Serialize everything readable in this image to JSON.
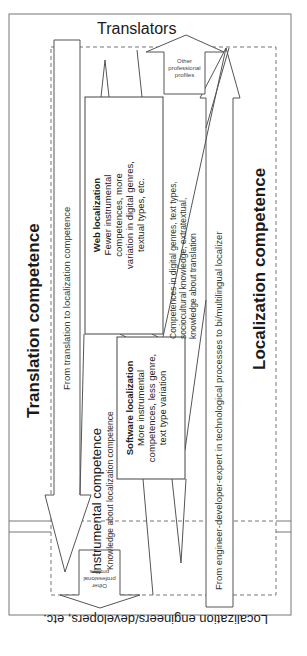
{
  "diagram": {
    "top_label": "Translators",
    "bottom_label": "Localization engineers/developers, etc.",
    "left_title": "Translation competence",
    "right_title": "Localization competence",
    "left_arrow_label": "From translation to localization competence",
    "right_arrow_label": "From engineer-developer-expert in technological processes to bi/multilingual localizer",
    "instrumental": {
      "title": "Instrumental competence",
      "subtitle": "Knowledge about localization competence"
    },
    "translation_knowledge": {
      "line1": "Competences in digital genres, text types,",
      "line2": "sociocultural knowledge, extratextual,",
      "line3": "knowledge about translation"
    },
    "web_localization": {
      "title": "Web localization",
      "line1": "Fewer instrumental",
      "line2": "competences, more",
      "line3": "variation in digital genres,",
      "line4": "textual types, etc."
    },
    "software_localization": {
      "title": "Software localization",
      "line1": "More instrumental",
      "line2": "competences, less genre,",
      "line3": "text type variation"
    },
    "other_profiles_top": {
      "line1": "Other",
      "line2": "professional",
      "line3": "profiles"
    },
    "other_profiles_bottom": {
      "line1": "Other",
      "line2": "professional",
      "line3": "profiles"
    }
  }
}
